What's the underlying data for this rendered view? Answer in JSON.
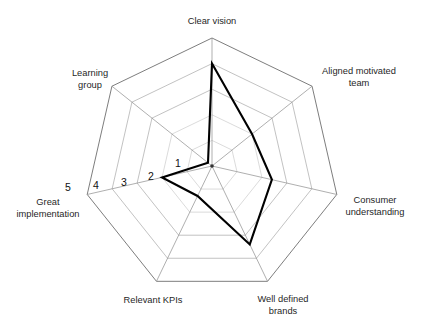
{
  "chart_data": {
    "type": "radar",
    "title": "",
    "subtitle": "",
    "xlabel": "",
    "ylabel": "",
    "grid": true,
    "legend": false,
    "legend_position": "none",
    "axis_count": 7,
    "radial_range": [
      0,
      5
    ],
    "radial_ticks": [
      1,
      2,
      3,
      4,
      5
    ],
    "radial_tick_labels": [
      "1",
      "2",
      "3",
      "4",
      "5"
    ],
    "radial_tick_axis": "Great implementation",
    "categories": [
      "Clear vision",
      "Aligned motivated team",
      "Consumer understanding",
      "Well defined brands",
      "Relevant KPIs",
      "Great implementation",
      "Learning group"
    ],
    "series": [
      {
        "name": "Assessment",
        "values": [
          4,
          2,
          2.4,
          3.4,
          1.3,
          2,
          0.2
        ],
        "color": "#000000"
      }
    ]
  },
  "chart": {
    "geometry": {
      "center_x": 212,
      "center_y": 166,
      "radius": 128,
      "rings": 5,
      "start_angle_deg": -90
    },
    "axis_labels": [
      {
        "text": "Clear vision",
        "lines": [
          "Clear vision"
        ],
        "x": 212,
        "y": 24,
        "anchor": "middle"
      },
      {
        "text": "Aligned motivated team",
        "lines": [
          "Aligned motivated",
          "team"
        ],
        "x": 359,
        "y": 74,
        "anchor": "middle"
      },
      {
        "text": "Consumer understanding",
        "lines": [
          "Consumer",
          "understanding"
        ],
        "x": 375,
        "y": 203,
        "anchor": "middle"
      },
      {
        "text": "Well defined brands",
        "lines": [
          "Well defined",
          "brands"
        ],
        "x": 283,
        "y": 302,
        "anchor": "middle"
      },
      {
        "text": "Relevant KPIs",
        "lines": [
          "Relevant KPIs"
        ],
        "x": 153,
        "y": 303,
        "anchor": "middle"
      },
      {
        "text": "Great implementation",
        "lines": [
          "Great",
          "implementation"
        ],
        "x": 48,
        "y": 205,
        "anchor": "middle"
      },
      {
        "text": "Learning group",
        "lines": [
          "Learning",
          "group"
        ],
        "x": 90,
        "y": 76,
        "anchor": "middle"
      }
    ],
    "tick_marks": [
      {
        "label": "1",
        "x": 178,
        "y": 167
      },
      {
        "label": "2",
        "x": 151,
        "y": 180
      },
      {
        "label": "3",
        "x": 124,
        "y": 186
      },
      {
        "label": "4",
        "x": 96,
        "y": 189
      },
      {
        "label": "5",
        "x": 68,
        "y": 191
      }
    ],
    "colors": {
      "series_line": "#000000",
      "grid_outer": "#6e6e6e",
      "grid_mid": "#a8a8a8",
      "grid_inner": "#c2c2c2",
      "spoke": "#8d8d8d",
      "label_text": "#1f1f1f",
      "background": "#ffffff"
    }
  }
}
